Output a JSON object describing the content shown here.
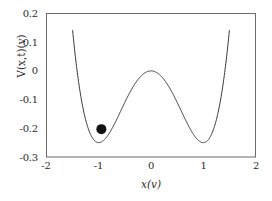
{
  "chart_data": {
    "type": "line",
    "title": "",
    "subtitle": "",
    "xlabel": "x(v)",
    "ylabel": "V(x,t)(v)",
    "xlim": [
      -2,
      2
    ],
    "ylim": [
      -0.3,
      0.2
    ],
    "xticks": [
      "-2",
      "-1",
      "0",
      "1",
      "2"
    ],
    "xtick_values": [
      -2,
      -1,
      0,
      1,
      2
    ],
    "yticks": [
      "0.2",
      "0.1",
      "0",
      "-0.1",
      "-0.2",
      "-0.3"
    ],
    "ytick_values": [
      0.2,
      0.1,
      0,
      -0.1,
      -0.2,
      -0.3
    ],
    "grid": false,
    "legend": null,
    "series": [
      {
        "name": "double-well potential",
        "color": "#3a3a3a",
        "x_domain": [
          -1.5,
          1.5
        ],
        "x": [
          -1.5,
          -1.4,
          -1.3,
          -1.2,
          -1.1,
          -1.0,
          -0.9,
          -0.8,
          -0.7,
          -0.6,
          -0.5,
          -0.4,
          -0.3,
          -0.2,
          -0.1,
          0.0,
          0.1,
          0.2,
          0.3,
          0.4,
          0.5,
          0.6,
          0.7,
          0.8,
          0.9,
          1.0,
          1.1,
          1.2,
          1.3,
          1.4,
          1.5
        ],
        "values": [
          0.141,
          0.0804,
          0.0299,
          -0.01,
          -0.0392,
          -0.0625,
          -0.0861,
          -0.0896,
          -0.1249,
          -0.1476,
          -0.1094,
          -0.0736,
          -0.043,
          -0.0196,
          -0.005,
          0.0,
          -0.005,
          -0.0196,
          -0.043,
          -0.0736,
          -0.1094,
          -0.1476,
          -0.1849,
          -0.2176,
          -0.241,
          -0.25,
          -0.2395,
          -0.2016,
          -0.1275,
          -0.0194,
          0.141
        ]
      }
    ],
    "annotations": [
      {
        "name": "ball-marker",
        "shape": "filled-circle",
        "x": -0.95,
        "y": -0.203,
        "color": "#111111",
        "radius_px": 5
      }
    ]
  },
  "axes": {
    "frame_color": "#6b6b6b",
    "curve_color": "#3a3a3a"
  }
}
